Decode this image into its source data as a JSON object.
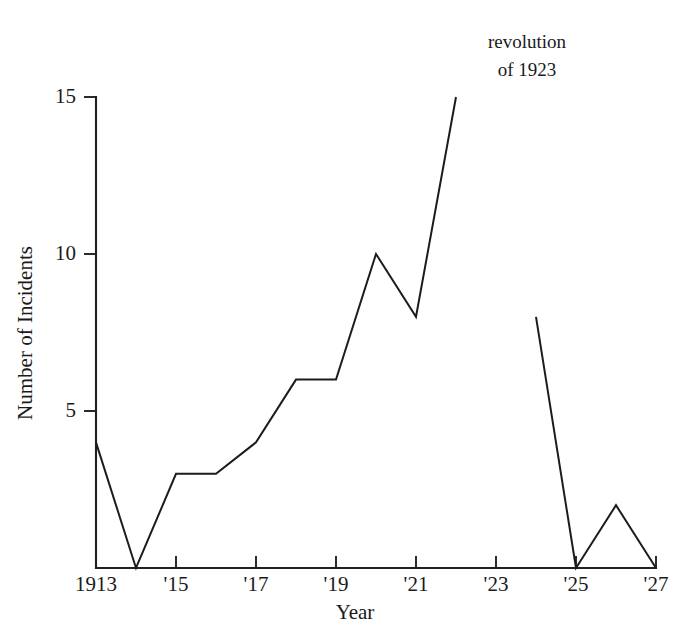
{
  "chart_data": {
    "type": "line",
    "title": "",
    "subtitle": "",
    "xlabel": "Year",
    "ylabel": "Number of Incidents",
    "x": [
      1913,
      1914,
      1915,
      1916,
      1917,
      1918,
      1919,
      1920,
      1921,
      1922,
      1924,
      1925,
      1926,
      1927
    ],
    "values": [
      4,
      0,
      3,
      3,
      4,
      6,
      6,
      10,
      8,
      15,
      8,
      0,
      2,
      0
    ],
    "series": [
      {
        "name": "Number of Incidents",
        "segments": [
          {
            "x": [
              1913,
              1914,
              1915,
              1916,
              1917,
              1918,
              1919,
              1920,
              1921,
              1922
            ],
            "values": [
              4,
              0,
              3,
              3,
              4,
              6,
              6,
              10,
              8,
              15
            ]
          },
          {
            "x": [
              1924,
              1925,
              1926,
              1927
            ],
            "values": [
              8,
              0,
              2,
              0
            ]
          }
        ]
      }
    ],
    "xlim": [
      1913,
      1927
    ],
    "ylim": [
      0,
      15
    ],
    "xticks": [
      1913,
      1915,
      1917,
      1919,
      1921,
      1923,
      1925,
      1927
    ],
    "xticklabels": [
      "1913",
      "'15",
      "'17",
      "'19",
      "'21",
      "'23",
      "'25",
      "'27"
    ],
    "yticks": [
      5,
      10,
      15
    ],
    "yticklabels": [
      "5",
      "10",
      "15"
    ],
    "grid": false,
    "legend": false,
    "legend_position": "none",
    "line_color": "#1c1c1c",
    "background_color": "#ffffff",
    "annotations": [
      {
        "name": "revolution-annotation",
        "line1": "revolution",
        "line2": "of 1923",
        "x": 1922,
        "y": 15
      }
    ]
  },
  "axes": {
    "y_title": "Number of Incidents",
    "x_title": "Year"
  }
}
